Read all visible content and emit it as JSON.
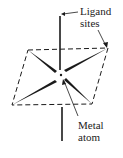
{
  "diagram": {
    "type": "square-planar coordination geometry",
    "labels": {
      "ligand_line1": "Ligand",
      "ligand_line2": "sites",
      "metal_line1": "Metal",
      "metal_line2": "atom"
    },
    "colors": {
      "ink": "#1a1a1a",
      "background": "#ffffff"
    }
  }
}
